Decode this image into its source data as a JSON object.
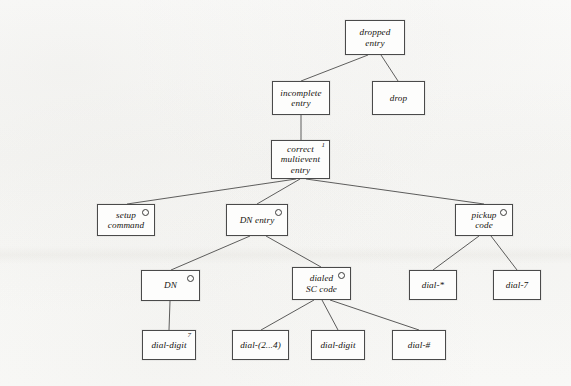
{
  "diagram": {
    "type": "tree",
    "background_color": "#fbfbfa",
    "box_border_color": "#4a4a4a",
    "edge_color": "#3b3b3b",
    "nodes": [
      {
        "id": "dropped-entry",
        "label": "dropped\nentry",
        "x": 345,
        "y": 20,
        "w": 60,
        "h": 35,
        "marker": null
      },
      {
        "id": "incomplete-entry",
        "label": "incomplete\nentry",
        "x": 272,
        "y": 81,
        "w": 58,
        "h": 34,
        "marker": null
      },
      {
        "id": "drop",
        "label": "drop",
        "x": 372,
        "y": 81,
        "w": 53,
        "h": 34,
        "marker": null
      },
      {
        "id": "correct-multievent-entry",
        "label": "correct\nmultievent\nentry",
        "x": 271,
        "y": 140,
        "w": 59,
        "h": 39,
        "marker": {
          "kind": "number",
          "text": "1"
        }
      },
      {
        "id": "setup-command",
        "label": "setup\ncommand",
        "x": 97,
        "y": 204,
        "w": 58,
        "h": 32,
        "marker": {
          "kind": "circle",
          "text": ""
        }
      },
      {
        "id": "dn-entry",
        "label": "DN entry",
        "x": 226,
        "y": 204,
        "w": 62,
        "h": 32,
        "marker": {
          "kind": "circle",
          "text": ""
        }
      },
      {
        "id": "pickup-code",
        "label": "pickup\ncode",
        "x": 455,
        "y": 204,
        "w": 58,
        "h": 32,
        "marker": {
          "kind": "circle",
          "text": ""
        }
      },
      {
        "id": "dn",
        "label": "DN",
        "x": 141,
        "y": 270,
        "w": 59,
        "h": 31,
        "marker": {
          "kind": "circle",
          "text": ""
        }
      },
      {
        "id": "dialed-sc-code",
        "label": "dialed\nSC code",
        "x": 292,
        "y": 267,
        "w": 59,
        "h": 33,
        "marker": {
          "kind": "circle",
          "text": ""
        }
      },
      {
        "id": "dial-star",
        "label": "dial-*",
        "x": 409,
        "y": 270,
        "w": 48,
        "h": 30,
        "marker": null
      },
      {
        "id": "dial-7",
        "label": "dial-7",
        "x": 493,
        "y": 270,
        "w": 48,
        "h": 30,
        "marker": null
      },
      {
        "id": "dial-digit-1",
        "label": "dial-digit",
        "x": 142,
        "y": 330,
        "w": 54,
        "h": 30,
        "marker": {
          "kind": "number",
          "text": "7"
        }
      },
      {
        "id": "dial-2-4",
        "label": "dial-(2...4)",
        "x": 232,
        "y": 330,
        "w": 57,
        "h": 30,
        "marker": null
      },
      {
        "id": "dial-digit-2",
        "label": "dial-digit",
        "x": 311,
        "y": 330,
        "w": 54,
        "h": 30,
        "marker": null
      },
      {
        "id": "dial-hash",
        "label": "dial-#",
        "x": 392,
        "y": 330,
        "w": 54,
        "h": 30,
        "marker": null
      }
    ],
    "edges": [
      {
        "from": "dropped-entry",
        "to": "incomplete-entry",
        "x1": 368,
        "y1": 55,
        "x2": 301,
        "y2": 81
      },
      {
        "from": "dropped-entry",
        "to": "drop",
        "x1": 381,
        "y1": 55,
        "x2": 398,
        "y2": 81
      },
      {
        "from": "incomplete-entry",
        "to": "correct-multievent-entry",
        "x1": 301,
        "y1": 115,
        "x2": 301,
        "y2": 140
      },
      {
        "from": "correct-multievent-entry",
        "to": "setup-command",
        "x1": 296,
        "y1": 179,
        "x2": 127,
        "y2": 204
      },
      {
        "from": "correct-multievent-entry",
        "to": "dn-entry",
        "x1": 300,
        "y1": 179,
        "x2": 257,
        "y2": 204
      },
      {
        "from": "correct-multievent-entry",
        "to": "pickup-code",
        "x1": 306,
        "y1": 179,
        "x2": 484,
        "y2": 204
      },
      {
        "from": "dn-entry",
        "to": "dn",
        "x1": 250,
        "y1": 236,
        "x2": 171,
        "y2": 270
      },
      {
        "from": "dn-entry",
        "to": "dialed-sc-code",
        "x1": 266,
        "y1": 236,
        "x2": 321,
        "y2": 267
      },
      {
        "from": "pickup-code",
        "to": "dial-star",
        "x1": 479,
        "y1": 236,
        "x2": 433,
        "y2": 270
      },
      {
        "from": "pickup-code",
        "to": "dial-7",
        "x1": 491,
        "y1": 236,
        "x2": 517,
        "y2": 270
      },
      {
        "from": "dn",
        "to": "dial-digit-1",
        "x1": 170,
        "y1": 301,
        "x2": 169,
        "y2": 330
      },
      {
        "from": "dialed-sc-code",
        "to": "dial-2-4",
        "x1": 314,
        "y1": 300,
        "x2": 261,
        "y2": 330
      },
      {
        "from": "dialed-sc-code",
        "to": "dial-digit-2",
        "x1": 322,
        "y1": 300,
        "x2": 338,
        "y2": 330
      },
      {
        "from": "dialed-sc-code",
        "to": "dial-hash",
        "x1": 330,
        "y1": 300,
        "x2": 419,
        "y2": 330
      }
    ]
  }
}
